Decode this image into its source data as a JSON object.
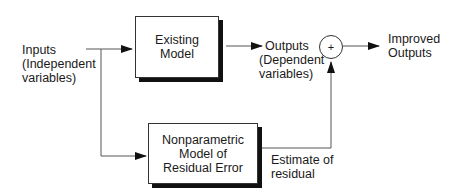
{
  "diagram": {
    "inputs": {
      "line1": "Inputs",
      "line2": "(Independent",
      "line3": "variables)"
    },
    "existing_model": {
      "line1": "Existing",
      "line2": "Model"
    },
    "outputs": {
      "line1": "Outputs",
      "line2": "(Dependent",
      "line3": "variables)"
    },
    "summing_junction": {
      "symbol": "+"
    },
    "improved_outputs": {
      "line1": "Improved",
      "line2": "Outputs"
    },
    "nonparametric_model": {
      "line1": "Nonparametric",
      "line2": "Model of",
      "line3": "Residual Error"
    },
    "estimate": {
      "line1": "Estimate of",
      "line2": "residual"
    }
  },
  "colors": {
    "line": "#555555",
    "arrowhead": "#111111",
    "shadow": "#111111"
  }
}
